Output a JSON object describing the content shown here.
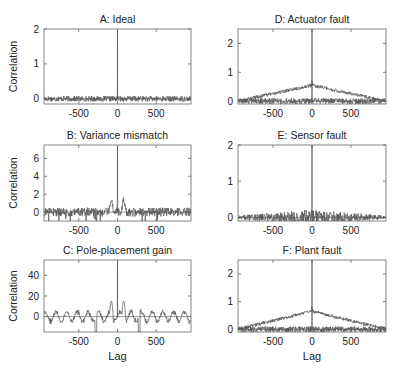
{
  "figure": {
    "xlabel": "Lag",
    "ylabel": "Correlation",
    "line_color": "#555555",
    "axis_color": "#666666"
  },
  "chart_data": [
    {
      "id": "A",
      "type": "line",
      "title": "A: Ideal",
      "xlabel": "",
      "ylabel": "Correlation",
      "xlim": [
        -950,
        950
      ],
      "ylim": [
        -0.15,
        2
      ],
      "xticks": [
        -500,
        0,
        500
      ],
      "yticks": [
        0,
        1,
        2
      ],
      "grid": false,
      "description": "Noise around 0 (amplitude ~0.08), single spike at lag 0 reaching ~2",
      "series": [
        {
          "name": "correlation",
          "peak_at_0": 2.0,
          "noise_amplitude": 0.08,
          "envelope": "flat"
        }
      ]
    },
    {
      "id": "B",
      "type": "line",
      "title": "B: Variance mismatch",
      "xlabel": "",
      "ylabel": "Correlation",
      "xlim": [
        -950,
        950
      ],
      "ylim": [
        -1,
        7.5
      ],
      "xticks": [
        -500,
        0,
        500
      ],
      "yticks": [
        0,
        2,
        4,
        6
      ],
      "grid": false,
      "description": "Noise around 0 (amplitude ~0.5), side lobes ~1.5 near |lag|≈80, central spike ~7.5",
      "series": [
        {
          "name": "correlation",
          "peak_at_0": 7.5,
          "noise_amplitude": 0.5,
          "side_lobe": 1.5,
          "envelope": "flat"
        }
      ]
    },
    {
      "id": "C",
      "type": "line",
      "title": "C: Pole-placement gain",
      "xlabel": "Lag",
      "ylabel": "Correlation",
      "xlim": [
        -950,
        950
      ],
      "ylim": [
        -15,
        55
      ],
      "xticks": [
        -500,
        0,
        500
      ],
      "yticks": [
        0,
        20,
        40
      ],
      "grid": false,
      "description": "Oscillatory correlation around 0 (amplitude ~6), side lobes ~15 at |lag|≈80, dips to -15 near lag ±280, central spike ~55",
      "series": [
        {
          "name": "correlation",
          "peak_at_0": 55,
          "noise_amplitude": 6,
          "side_lobe": 15,
          "envelope": "flat"
        }
      ]
    },
    {
      "id": "D",
      "type": "line",
      "title": "D: Actuator fault",
      "xlabel": "",
      "ylabel": "",
      "xlim": [
        -950,
        950
      ],
      "ylim": [
        -0.1,
        2.5
      ],
      "xticks": [
        -500,
        0,
        500
      ],
      "yticks": [
        0,
        1,
        2
      ],
      "grid": false,
      "description": "Two curves: triangular envelope rising from 0 at |lag|=950 to ~0.55 at 0, and a flat noisy curve near 0; spike at 0 to ~2.5",
      "series": [
        {
          "name": "triangular",
          "peak_at_0": 0.55,
          "envelope": "triangle"
        },
        {
          "name": "flat",
          "peak_at_0": 2.5,
          "noise_amplitude": 0.1,
          "envelope": "flat"
        }
      ]
    },
    {
      "id": "E",
      "type": "line",
      "title": "E: Sensor fault",
      "xlabel": "",
      "ylabel": "",
      "xlim": [
        -950,
        950
      ],
      "ylim": [
        -0.1,
        2
      ],
      "xticks": [
        -500,
        0,
        500
      ],
      "yticks": [
        0,
        1,
        2
      ],
      "grid": false,
      "description": "Dense noisy band around 0 widening toward lag 0 (~±0.25), spike at 0 to ~2",
      "series": [
        {
          "name": "correlation",
          "peak_at_0": 2.0,
          "noise_amplitude": 0.22,
          "envelope": "triangle-noise"
        }
      ]
    },
    {
      "id": "F",
      "type": "line",
      "title": "F: Plant fault",
      "xlabel": "Lag",
      "ylabel": "",
      "xlim": [
        -950,
        950
      ],
      "ylim": [
        -0.1,
        2.5
      ],
      "xticks": [
        -500,
        0,
        500
      ],
      "yticks": [
        0,
        1,
        2
      ],
      "grid": false,
      "description": "Two curves: triangular envelope rising from 0 at |lag|=950 to ~0.65 at 0, and a flat noisy curve near 0; spike at 0 to ~2.5",
      "series": [
        {
          "name": "triangular",
          "peak_at_0": 0.65,
          "envelope": "triangle"
        },
        {
          "name": "flat",
          "peak_at_0": 2.5,
          "noise_amplitude": 0.1,
          "envelope": "flat"
        }
      ]
    }
  ],
  "layout": {
    "panels": [
      {
        "id": "A",
        "x": 44,
        "y": 29,
        "w": 147,
        "h": 75
      },
      {
        "id": "B",
        "x": 44,
        "y": 145,
        "w": 147,
        "h": 76
      },
      {
        "id": "C",
        "x": 44,
        "y": 260,
        "w": 147,
        "h": 72
      },
      {
        "id": "D",
        "x": 238,
        "y": 29,
        "w": 148,
        "h": 75
      },
      {
        "id": "E",
        "x": 238,
        "y": 145,
        "w": 148,
        "h": 76
      },
      {
        "id": "F",
        "x": 238,
        "y": 260,
        "w": 148,
        "h": 72
      }
    ]
  }
}
